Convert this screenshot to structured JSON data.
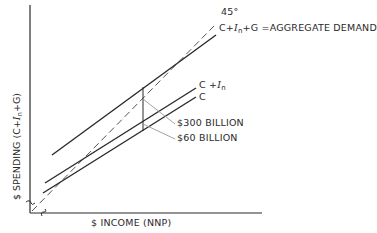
{
  "diagram": {
    "type": "keynesian-cross",
    "axes": {
      "x_label": "$ INCOME (NNP)",
      "y_label_prefix": "$ SPENDING (C+",
      "y_label_sub_var": "I",
      "y_label_sub": "n",
      "y_label_suffix": "+G)"
    },
    "lines": {
      "forty_five": {
        "label": "45°",
        "style": "dashed"
      },
      "aggregate_demand": {
        "label_prefix": "C+",
        "label_var": "I",
        "label_sub": "n",
        "label_suffix": "+G =AGGREGATE DEMAND"
      },
      "c_plus_in": {
        "label_prefix": "C +",
        "label_var": "I",
        "label_sub": "n"
      },
      "c": {
        "label": "C"
      }
    },
    "annotations": {
      "gap_300": "$300 BILLION",
      "gap_60": "$60 BILLION"
    },
    "colors": {
      "ink": "#2a2a2a",
      "leader": "#9a9a9a",
      "background": "#ffffff"
    }
  }
}
